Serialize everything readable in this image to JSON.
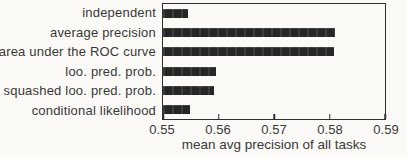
{
  "figure": {
    "background_color": "#fbfaf7",
    "ink_color": "#2f2f2f",
    "bar_color": "#262626"
  },
  "chart_data": {
    "type": "bar",
    "orientation": "horizontal",
    "title": "",
    "xlabel": "mean avg precision of all tasks",
    "ylabel": "",
    "categories": [
      "independent",
      "average precision",
      "area under the ROC curve",
      "loo. pred. prob.",
      "squashed loo. pred. prob.",
      "conditional likelihood"
    ],
    "values": [
      0.5545,
      0.581,
      0.5808,
      0.5596,
      0.5592,
      0.5548
    ],
    "xlim": [
      0.55,
      0.59
    ],
    "xticks": [
      0.55,
      0.56,
      0.57,
      0.58,
      0.59
    ],
    "xtick_labels": [
      "0.55",
      "0.56",
      "0.57",
      "0.58",
      "0.59"
    ],
    "grid": false,
    "legend": "none"
  }
}
